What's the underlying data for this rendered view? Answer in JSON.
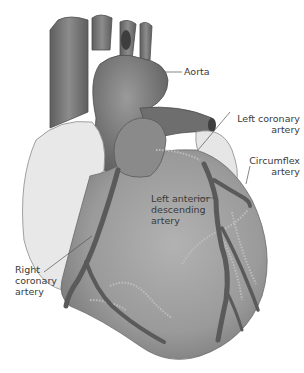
{
  "diagram": {
    "colors": {
      "vessel_dark": "#6f6f6f",
      "vessel_mid": "#8a8a8a",
      "ventricle": "#9a9a9a",
      "atrium_light": "#e6e6e6",
      "artery": "#5a5a5a",
      "label_text": "#3a3a3a",
      "leader_line": "#555555"
    },
    "labels": {
      "aorta": "Aorta",
      "left_coronary_1": "Left coronary",
      "left_coronary_2": "artery",
      "circumflex_1": "Circumflex",
      "circumflex_2": "artery",
      "lad_1": "Left anterior",
      "lad_2": "descending",
      "lad_3": "artery",
      "right_coronary_1": "Right",
      "right_coronary_2": "coronary",
      "right_coronary_3": "artery"
    }
  }
}
